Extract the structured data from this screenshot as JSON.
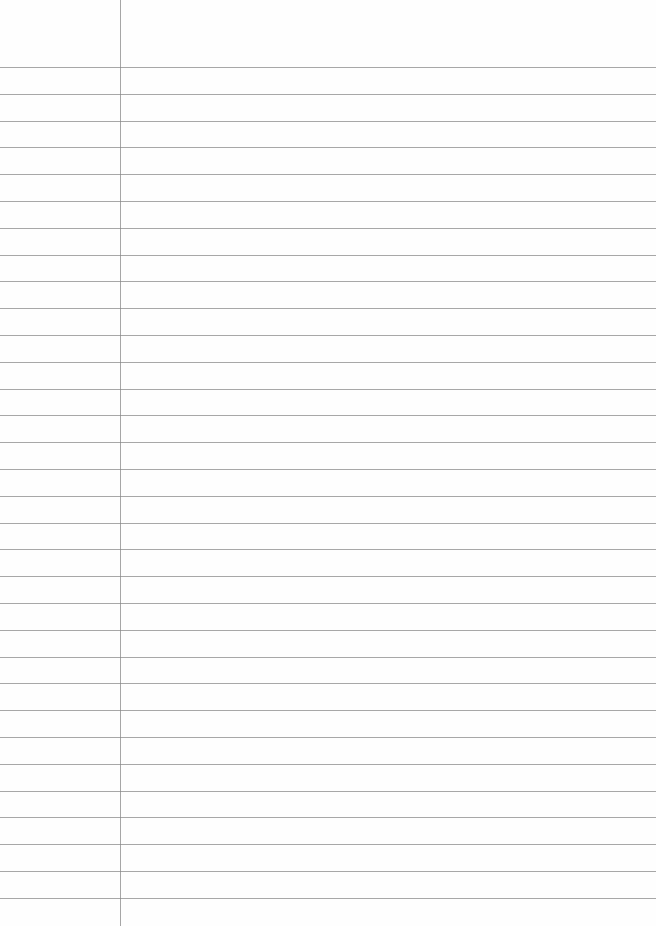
{
  "page": {
    "type": "lined-paper",
    "background_color": "#fefefe",
    "rule_color": "#8a8a8a",
    "margin_line_color": "#888888",
    "margin_x": 120,
    "first_rule_y": 67,
    "rule_spacing": 26.8,
    "rule_count": 32
  }
}
